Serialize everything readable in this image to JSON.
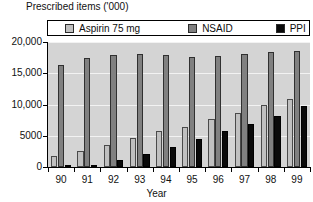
{
  "chart_data": {
    "type": "bar",
    "title": "Prescribed items ('000)",
    "xlabel": "Year",
    "ylabel": "",
    "categories": [
      "90",
      "91",
      "92",
      "93",
      "94",
      "95",
      "96",
      "97",
      "98",
      "99"
    ],
    "ylim": [
      0,
      20000
    ],
    "yticks": [
      0,
      5000,
      10000,
      15000,
      20000
    ],
    "ytick_labels": [
      "0",
      "5000",
      "10,000",
      "15,000",
      "20,000"
    ],
    "grid": true,
    "legend_position": "top",
    "series": [
      {
        "name": "Aspirin 75 mg",
        "color": "#c0c0c0",
        "values": [
          1800,
          2600,
          3600,
          4600,
          5800,
          6400,
          7700,
          8700,
          9900,
          10900
        ]
      },
      {
        "name": "NSAID",
        "color": "#808080",
        "values": [
          16400,
          17400,
          18000,
          18100,
          18000,
          17600,
          17800,
          18100,
          18400,
          18600
        ]
      },
      {
        "name": "PPI",
        "color": "#0a0a0a",
        "values": [
          150,
          400,
          1150,
          2150,
          3200,
          4500,
          5700,
          6900,
          8200,
          9700
        ]
      }
    ]
  }
}
